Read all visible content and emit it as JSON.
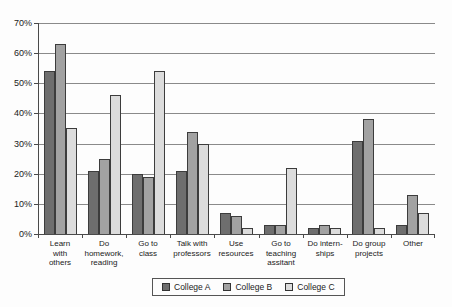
{
  "chart_data": {
    "type": "bar",
    "title": "",
    "xlabel": "",
    "ylabel": "",
    "categories": [
      "Learn with others",
      "Do homework, reading",
      "Go to class",
      "Talk with professors",
      "Use resources",
      "Go to teaching assitant",
      "Do internships",
      "Do group projects",
      "Other"
    ],
    "category_label_lines": [
      [
        "Learn",
        "with",
        "others"
      ],
      [
        "Do",
        "homework,",
        "reading"
      ],
      [
        "Go to",
        "class"
      ],
      [
        "Talk with",
        "professors"
      ],
      [
        "Use",
        "resources"
      ],
      [
        "Go to",
        "teaching",
        "assitant"
      ],
      [
        "Do intern-",
        "ships"
      ],
      [
        "Do group",
        "projects"
      ],
      [
        "Other"
      ]
    ],
    "series": [
      {
        "name": "College A",
        "color": "#6e6e6e",
        "values": [
          54,
          21,
          20,
          21,
          7,
          3,
          2,
          31,
          3
        ]
      },
      {
        "name": "College B",
        "color": "#a2a2a2",
        "values": [
          63,
          25,
          19,
          34,
          6,
          3,
          3,
          38,
          13
        ]
      },
      {
        "name": "College C",
        "color": "#dcdcdc",
        "values": [
          35,
          46,
          54,
          30,
          2,
          22,
          2,
          2,
          7
        ]
      }
    ],
    "y_axis": {
      "min": 0,
      "max": 70,
      "step": 10,
      "tick_labels": [
        "0%",
        "10%",
        "20%",
        "30%",
        "40%",
        "50%",
        "60%",
        "70%"
      ]
    },
    "grid": true,
    "legend_position": "bottom",
    "colors": {
      "axis": "#4a4a4a",
      "gridline": "#8a8a8a",
      "bar_outline": "#3c3c3c",
      "background": "#fdfdfd"
    }
  }
}
